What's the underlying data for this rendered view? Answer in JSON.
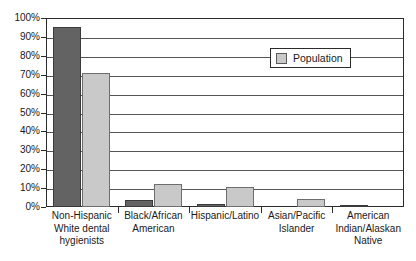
{
  "chart_data": {
    "type": "bar",
    "title": "",
    "subtitle": "",
    "xlabel": "",
    "ylabel": "",
    "ylim": [
      0,
      100
    ],
    "y_tick_labels": [
      "100%",
      "90%",
      "80%",
      "70%",
      "60%",
      "50%",
      "40%",
      "30%",
      "20%",
      "10%",
      "0%"
    ],
    "y_tick_values": [
      100,
      90,
      80,
      70,
      60,
      50,
      40,
      30,
      20,
      10,
      0
    ],
    "grid": true,
    "grid_axis": "y",
    "legend": {
      "position": "upper-right-inside",
      "entries": [
        {
          "label": "Population",
          "color": "#c9c9c9"
        }
      ]
    },
    "categories": [
      "Non-Hispanic White dental hygienists",
      "Black/African American",
      "Hispanic/Latino",
      "Asian/Pacific Islander",
      "American Indian/Alaskan Native"
    ],
    "category_label_lines": [
      [
        "Non-Hispanic",
        "White dental",
        "hygienists"
      ],
      [
        "Black/African",
        "American"
      ],
      [
        "Hispanic/Latino"
      ],
      [
        "Asian/Pacific",
        "Islander"
      ],
      [
        "American",
        "Indian/Alaskan",
        "Native"
      ]
    ],
    "series": [
      {
        "name": "Dental hygienists",
        "color": "#636363",
        "values": [
          95,
          3.5,
          1.5,
          0,
          1
        ]
      },
      {
        "name": "Population",
        "color": "#c9c9c9",
        "values": [
          71,
          12,
          10.5,
          4.5,
          0
        ]
      }
    ],
    "colors": {
      "dark_bar": "#636363",
      "light_bar": "#c9c9c9",
      "axis": "#2b2b2b",
      "gridline": "#555555",
      "background": "#ffffff"
    }
  }
}
